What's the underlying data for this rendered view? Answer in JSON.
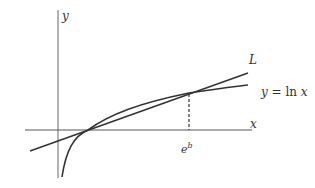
{
  "diagram": {
    "axes": {
      "x_label": "x",
      "y_label": "y"
    },
    "curve_label": "y = ln x",
    "curve_label_parts": {
      "lhs": "y",
      "eq": " = ",
      "fn": "ln ",
      "var": "x"
    },
    "tangent_label": "L",
    "point_label_base": "e",
    "point_label_exp": "b",
    "colors": {
      "curve": "#333333",
      "axis": "#555555",
      "background": "#ffffff"
    }
  }
}
